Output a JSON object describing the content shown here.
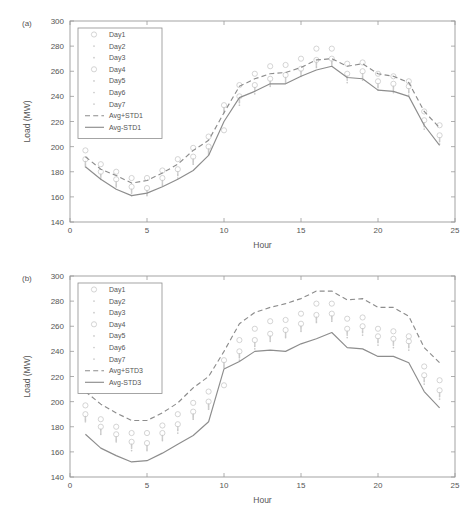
{
  "figure": {
    "panels": [
      {
        "label": "(a)",
        "xlabel": "Hour",
        "ylabel": "Load (MW)",
        "legend": [
          "Day1",
          "Day2",
          "Day3",
          "Day4",
          "Day5",
          "Day6",
          "Day7",
          "Avg+STD1",
          "Avg-STD1"
        ]
      },
      {
        "label": "(b)",
        "xlabel": "Hour",
        "ylabel": "Load (MW)",
        "legend": [
          "Day1",
          "Day2",
          "Day3",
          "Day4",
          "Day5",
          "Day6",
          "Day7",
          "Avg+STD3",
          "Avg-STD3"
        ]
      }
    ],
    "colors": {
      "axis": "#9a9a9a",
      "text": "#555555",
      "band_line": "#8d8d8d",
      "marker": "#c9c9c9",
      "background": "#ffffff"
    }
  },
  "chart_data": [
    {
      "type": "line",
      "title": "(a)",
      "xlabel": "Hour",
      "ylabel": "Load (MW)",
      "xlim": [
        0,
        25
      ],
      "ylim": [
        140,
        300
      ],
      "xticks": [
        0,
        5,
        10,
        15,
        20,
        25
      ],
      "yticks": [
        140,
        160,
        180,
        200,
        220,
        240,
        260,
        280,
        300
      ],
      "grid": false,
      "legend_position": "upper-left-inside",
      "x": [
        1,
        2,
        3,
        4,
        5,
        6,
        7,
        8,
        9,
        10,
        11,
        12,
        13,
        14,
        15,
        16,
        17,
        18,
        19,
        20,
        21,
        22,
        23,
        24
      ],
      "series": [
        {
          "name": "Day1",
          "marker": "circle",
          "values": [
            197,
            186,
            180,
            175,
            175,
            181,
            190,
            199,
            208,
            213,
            249,
            258,
            264,
            265,
            270,
            278,
            278,
            266,
            267,
            258,
            256,
            252,
            228,
            217
          ]
        },
        {
          "name": "Day2",
          "marker": "dot",
          "values": [
            184,
            174,
            168,
            161,
            161,
            169,
            175,
            186,
            194,
            227,
            233,
            242,
            248,
            251,
            256,
            263,
            264,
            251,
            253,
            245,
            243,
            241,
            214,
            202
          ]
        },
        {
          "name": "Day3",
          "marker": "dot",
          "values": [
            188,
            178,
            172,
            166,
            165,
            173,
            180,
            190,
            198,
            231,
            238,
            247,
            252,
            255,
            260,
            267,
            268,
            256,
            258,
            250,
            248,
            246,
            219,
            207
          ]
        },
        {
          "name": "Day4",
          "marker": "circle",
          "values": [
            190,
            180,
            174,
            168,
            167,
            175,
            182,
            192,
            200,
            233,
            240,
            249,
            254,
            257,
            262,
            269,
            270,
            258,
            260,
            252,
            250,
            248,
            221,
            209
          ]
        },
        {
          "name": "Day5",
          "marker": "dot",
          "values": [
            186,
            176,
            170,
            164,
            163,
            171,
            178,
            188,
            196,
            229,
            236,
            245,
            250,
            253,
            258,
            265,
            266,
            254,
            256,
            248,
            246,
            244,
            217,
            205
          ]
        },
        {
          "name": "Day6",
          "marker": "dot",
          "values": [
            187,
            177,
            171,
            165,
            164,
            172,
            179,
            189,
            197,
            230,
            237,
            246,
            251,
            254,
            259,
            266,
            267,
            255,
            257,
            249,
            247,
            245,
            218,
            206
          ]
        },
        {
          "name": "Day7",
          "marker": "dot",
          "values": [
            185,
            175,
            169,
            163,
            162,
            170,
            177,
            187,
            195,
            228,
            235,
            244,
            249,
            252,
            257,
            264,
            265,
            253,
            255,
            247,
            245,
            243,
            216,
            204
          ]
        },
        {
          "name": "Avg+STD1",
          "style": "dashed",
          "values": [
            192,
            182,
            177,
            171,
            173,
            179,
            186,
            197,
            205,
            227,
            248,
            254,
            258,
            259,
            263,
            269,
            270,
            264,
            266,
            258,
            256,
            251,
            228,
            215
          ]
        },
        {
          "name": "Avg-STD1",
          "style": "solid",
          "values": [
            184,
            174,
            166,
            161,
            163,
            168,
            174,
            181,
            193,
            220,
            239,
            244,
            250,
            250,
            256,
            261,
            264,
            255,
            254,
            245,
            244,
            240,
            217,
            201
          ]
        }
      ]
    },
    {
      "type": "line",
      "title": "(b)",
      "xlabel": "Hour",
      "ylabel": "Load (MW)",
      "xlim": [
        0,
        25
      ],
      "ylim": [
        140,
        300
      ],
      "xticks": [
        0,
        5,
        10,
        15,
        20,
        25
      ],
      "yticks": [
        140,
        160,
        180,
        200,
        220,
        240,
        260,
        280,
        300
      ],
      "grid": false,
      "legend_position": "upper-left-inside",
      "x": [
        1,
        2,
        3,
        4,
        5,
        6,
        7,
        8,
        9,
        10,
        11,
        12,
        13,
        14,
        15,
        16,
        17,
        18,
        19,
        20,
        21,
        22,
        23,
        24
      ],
      "series": [
        {
          "name": "Day1",
          "marker": "circle",
          "values": [
            197,
            186,
            180,
            175,
            175,
            181,
            190,
            199,
            208,
            213,
            249,
            258,
            264,
            265,
            270,
            278,
            278,
            266,
            267,
            258,
            256,
            252,
            228,
            217
          ]
        },
        {
          "name": "Day2",
          "marker": "dot",
          "values": [
            184,
            174,
            168,
            161,
            161,
            169,
            175,
            186,
            194,
            227,
            233,
            242,
            248,
            251,
            256,
            263,
            264,
            251,
            253,
            245,
            243,
            241,
            214,
            202
          ]
        },
        {
          "name": "Day3",
          "marker": "dot",
          "values": [
            188,
            178,
            172,
            166,
            165,
            173,
            180,
            190,
            198,
            231,
            238,
            247,
            252,
            255,
            260,
            267,
            268,
            256,
            258,
            250,
            248,
            246,
            219,
            207
          ]
        },
        {
          "name": "Day4",
          "marker": "circle",
          "values": [
            190,
            180,
            174,
            168,
            167,
            175,
            182,
            192,
            200,
            233,
            240,
            249,
            254,
            257,
            262,
            269,
            270,
            258,
            260,
            252,
            250,
            248,
            221,
            209
          ]
        },
        {
          "name": "Day5",
          "marker": "dot",
          "values": [
            186,
            176,
            170,
            164,
            163,
            171,
            178,
            188,
            196,
            229,
            236,
            245,
            250,
            253,
            258,
            265,
            266,
            254,
            256,
            248,
            246,
            244,
            217,
            205
          ]
        },
        {
          "name": "Day6",
          "marker": "dot",
          "values": [
            187,
            177,
            171,
            165,
            164,
            172,
            179,
            189,
            197,
            230,
            237,
            246,
            251,
            254,
            259,
            266,
            267,
            255,
            257,
            249,
            247,
            245,
            218,
            206
          ]
        },
        {
          "name": "Day7",
          "marker": "dot",
          "values": [
            185,
            175,
            169,
            163,
            162,
            170,
            177,
            187,
            195,
            228,
            235,
            244,
            249,
            252,
            257,
            264,
            265,
            253,
            255,
            247,
            245,
            243,
            216,
            204
          ]
        },
        {
          "name": "Avg+STD3",
          "style": "dashed",
          "values": [
            208,
            198,
            191,
            185,
            185,
            191,
            199,
            211,
            220,
            240,
            262,
            271,
            275,
            278,
            282,
            288,
            288,
            281,
            282,
            275,
            275,
            268,
            243,
            231
          ]
        },
        {
          "name": "Avg-STD3",
          "style": "solid",
          "values": [
            174,
            163,
            157,
            152,
            153,
            159,
            166,
            173,
            184,
            226,
            232,
            240,
            241,
            240,
            246,
            250,
            255,
            243,
            242,
            236,
            236,
            231,
            208,
            195
          ]
        }
      ]
    }
  ]
}
